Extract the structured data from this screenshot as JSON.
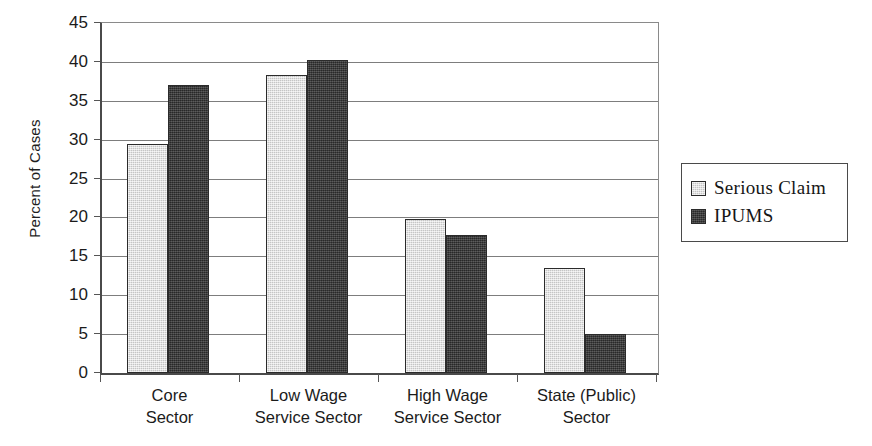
{
  "chart_data": {
    "type": "bar",
    "title": "",
    "subtitle": "",
    "xlabel": "",
    "ylabel": "Percent of Cases",
    "ylim": [
      0,
      45
    ],
    "ytick_step": 5,
    "yticks": [
      0,
      5,
      10,
      15,
      20,
      25,
      30,
      35,
      40,
      45
    ],
    "ytick_labels": [
      "0",
      "5",
      "10",
      "15",
      "20",
      "25",
      "30",
      "35",
      "40",
      "45"
    ],
    "grid": "horizontal",
    "legend_position": "right",
    "categories": [
      "Core\nSector",
      "Low Wage\nService Sector",
      "High Wage\nService Sector",
      "State (Public)\nSector"
    ],
    "series": [
      {
        "name": "Serious Claim",
        "color": "#d6d6d6",
        "values": [
          29.5,
          38.3,
          19.8,
          13.5
        ]
      },
      {
        "name": "IPUMS",
        "color": "#3a3a3a",
        "values": [
          37.0,
          40.2,
          17.8,
          5.0
        ]
      }
    ]
  },
  "legend": {
    "items": [
      {
        "label": "Serious Claim",
        "swatch": "light-gray-swatch"
      },
      {
        "label": "IPUMS",
        "swatch": "dark-gray-swatch"
      }
    ]
  },
  "axes": {
    "y_title": "Percent of Cases"
  },
  "colors": {
    "series_light": "#d6d6d6",
    "series_dark": "#3a3a3a",
    "axis": "#4a4a4a",
    "gridline": "#7d7d7d",
    "background": "#ffffff"
  }
}
